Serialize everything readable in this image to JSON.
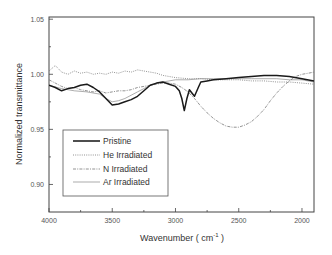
{
  "chart_data": {
    "type": "line",
    "title": "",
    "xlabel": "Wavenumber ( cm",
    "xlabel_sup": "-1",
    "xlabel_close": " )",
    "ylabel": "Normalized transmittance",
    "xlim": [
      4000,
      1905
    ],
    "ylim": [
      0.875,
      1.052
    ],
    "x_reversed": true,
    "xticks": [
      4000,
      3500,
      3000,
      2500,
      2000
    ],
    "xtick_labels": [
      "4000",
      "3500",
      "3000",
      "2500",
      "2000"
    ],
    "x_minor_ticks": [
      3750,
      3250,
      2750,
      2250
    ],
    "yticks": [
      1.05,
      1.0,
      0.95,
      0.9
    ],
    "ytick_labels": [
      "1.05",
      "1.00",
      "0.95",
      "0.90"
    ],
    "y_minor_ticks": [
      1.025,
      0.975,
      0.925
    ],
    "grid": false,
    "legend_position": "lower left",
    "series": [
      {
        "name": "Pristine",
        "style": "thick-solid",
        "x": [
          4000,
          3950,
          3900,
          3850,
          3800,
          3750,
          3700,
          3650,
          3600,
          3550,
          3500,
          3450,
          3400,
          3350,
          3300,
          3250,
          3200,
          3150,
          3100,
          3050,
          3000,
          2970,
          2950,
          2930,
          2910,
          2890,
          2870,
          2850,
          2820,
          2800,
          2750,
          2700,
          2600,
          2500,
          2400,
          2300,
          2200,
          2100,
          2000,
          1905
        ],
        "values": [
          0.99,
          0.988,
          0.985,
          0.987,
          0.988,
          0.99,
          0.991,
          0.988,
          0.984,
          0.978,
          0.972,
          0.973,
          0.975,
          0.977,
          0.98,
          0.985,
          0.99,
          0.992,
          0.993,
          0.991,
          0.989,
          0.985,
          0.978,
          0.967,
          0.978,
          0.986,
          0.983,
          0.98,
          0.988,
          0.993,
          0.994,
          0.995,
          0.996,
          0.997,
          0.998,
          0.999,
          0.999,
          0.998,
          0.996,
          0.994
        ]
      },
      {
        "name": "He Irradiated",
        "style": "dotted",
        "x": [
          4000,
          3950,
          3900,
          3850,
          3800,
          3750,
          3700,
          3650,
          3600,
          3550,
          3500,
          3450,
          3400,
          3350,
          3300,
          3250,
          3200,
          3150,
          3100,
          3050,
          3000,
          2900,
          2800,
          2700,
          2600,
          2500,
          2400,
          2300,
          2200,
          2100,
          2000,
          1905
        ],
        "values": [
          1.003,
          1.008,
          1.002,
          1.0,
          1.003,
          1.001,
          1.002,
          1.0,
          1.001,
          1.0,
          1.002,
          1.001,
          1.003,
          1.002,
          1.004,
          1.003,
          1.002,
          1.001,
          0.999,
          0.998,
          0.997,
          0.996,
          0.996,
          0.995,
          0.995,
          0.995,
          0.994,
          0.994,
          0.993,
          0.993,
          0.992,
          0.991
        ]
      },
      {
        "name": "N Irradiated",
        "style": "dash-dot",
        "x": [
          4000,
          3950,
          3900,
          3850,
          3800,
          3750,
          3700,
          3650,
          3600,
          3550,
          3500,
          3450,
          3400,
          3350,
          3300,
          3250,
          3200,
          3150,
          3100,
          3050,
          3000,
          2950,
          2900,
          2850,
          2800,
          2750,
          2700,
          2650,
          2600,
          2550,
          2500,
          2450,
          2400,
          2350,
          2300,
          2250,
          2200,
          2150,
          2100,
          2050,
          2000,
          1950,
          1905
        ],
        "values": [
          0.995,
          0.992,
          0.989,
          0.987,
          0.988,
          0.986,
          0.985,
          0.984,
          0.985,
          0.983,
          0.984,
          0.985,
          0.985,
          0.986,
          0.988,
          0.989,
          0.99,
          0.991,
          0.992,
          0.992,
          0.991,
          0.988,
          0.984,
          0.978,
          0.971,
          0.965,
          0.96,
          0.956,
          0.953,
          0.952,
          0.952,
          0.954,
          0.957,
          0.962,
          0.968,
          0.976,
          0.983,
          0.989,
          0.994,
          0.998,
          1.0,
          1.001,
          1.002
        ]
      },
      {
        "name": "Ar Irradiated",
        "style": "thin-solid",
        "x": [
          4000,
          3900,
          3800,
          3700,
          3600,
          3550,
          3500,
          3450,
          3400,
          3350,
          3300,
          3250,
          3200,
          3100,
          3000,
          2900,
          2800,
          2700,
          2600,
          2500,
          2400,
          2300,
          2200,
          2100,
          2000,
          1905
        ],
        "values": [
          0.99,
          0.987,
          0.985,
          0.984,
          0.982,
          0.978,
          0.975,
          0.976,
          0.978,
          0.981,
          0.984,
          0.987,
          0.99,
          0.993,
          0.995,
          0.995,
          0.996,
          0.996,
          0.996,
          0.996,
          0.996,
          0.996,
          0.996,
          0.995,
          0.995,
          0.993
        ]
      }
    ]
  },
  "legend": {
    "items": [
      {
        "label": "Pristine"
      },
      {
        "label": "He Irradiated"
      },
      {
        "label": "N Irradiated"
      },
      {
        "label": "Ar Irradiated"
      }
    ]
  }
}
